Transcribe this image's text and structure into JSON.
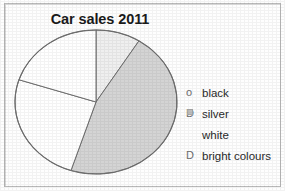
{
  "chart_data": {
    "type": "pie",
    "title": "Car sales 2011",
    "xlabel": "",
    "ylabel": "",
    "legend_position": "right",
    "grid": false,
    "categories": [
      "black",
      "silver",
      "white",
      "bright colours"
    ],
    "values": [
      9,
      46,
      25,
      20
    ],
    "colors": [
      "#f0f0f0",
      "#d3d3d3",
      "#ffffff",
      "#ffffff"
    ],
    "slices": [
      {
        "label": "black",
        "value": 9,
        "start_angle_deg": 0,
        "end_angle_deg": 32,
        "color": "#efefef"
      },
      {
        "label": "silver",
        "value": 46,
        "start_angle_deg": 32,
        "end_angle_deg": 198,
        "color": "#d4d4d4"
      },
      {
        "label": "white",
        "value": 25,
        "start_angle_deg": 198,
        "end_angle_deg": 288,
        "color": "#ffffff"
      },
      {
        "label": "bright colours",
        "value": 20,
        "start_angle_deg": 288,
        "end_angle_deg": 360,
        "color": "#ffffff"
      }
    ]
  },
  "chart": {
    "title": "Car sales 2011"
  },
  "legend": {
    "items": [
      {
        "marker": "o",
        "marker_type": "circle-glyph",
        "label": "black"
      },
      {
        "marker": "D",
        "marker_type": "square-swatch",
        "label": "silver"
      },
      {
        "marker": "",
        "marker_type": "none",
        "label": "white"
      },
      {
        "marker": "D",
        "marker_type": "letter-glyph",
        "label": "bright colours"
      }
    ]
  },
  "colors": {
    "page_background": "#fefefe",
    "border": "#b9b9b9",
    "pie_outline": "#6f6f6f",
    "slice_black": "#efefef",
    "slice_silver": "#d4d4d4",
    "slice_white": "#ffffff",
    "slice_bright": "#ffffff",
    "text": "#1b1b1b"
  }
}
